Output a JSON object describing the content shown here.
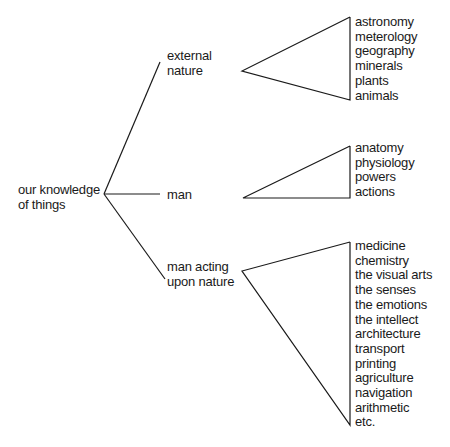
{
  "root": {
    "label_line1": "our knowledge",
    "label_line2": "of things"
  },
  "branches": [
    {
      "label_line1": "external",
      "label_line2": "nature",
      "items": [
        "astronomy",
        "meterology",
        "geography",
        "minerals",
        "plants",
        "animals"
      ]
    },
    {
      "label_line1": "man",
      "label_line2": "",
      "items": [
        "anatomy",
        "physiology",
        "powers",
        "actions"
      ]
    },
    {
      "label_line1": "man acting",
      "label_line2": "upon nature",
      "items": [
        "medicine",
        "chemistry",
        "the visual arts",
        "the senses",
        "the emotions",
        "the intellect",
        "architecture",
        "transport",
        "printing",
        "agriculture",
        "navigation",
        "arithmetic"
      ],
      "trailing": "etc."
    }
  ]
}
